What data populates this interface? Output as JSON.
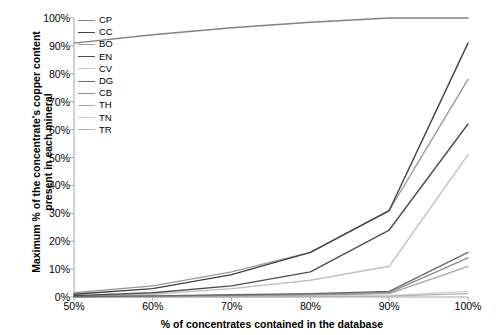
{
  "chart_data": {
    "type": "line",
    "title": "",
    "xlabel": "% of concentrates contained in the database",
    "ylabel": "Maximum % of the concentrate's copper content present in each mineral",
    "x": [
      50,
      60,
      70,
      80,
      90,
      100
    ],
    "x_tick_labels": [
      "50%",
      "60%",
      "70%",
      "80%",
      "90%",
      "100%"
    ],
    "y_tick_labels": [
      "0%",
      "10%",
      "20%",
      "30%",
      "40%",
      "50%",
      "60%",
      "70%",
      "80%",
      "90%",
      "100%"
    ],
    "xlim": [
      50,
      100
    ],
    "ylim": [
      0,
      100
    ],
    "grid": false,
    "legend_position": "upper-left-inside",
    "series": [
      {
        "name": "CP",
        "color": "#808080",
        "width": 1.4,
        "values": [
          91,
          94,
          96.5,
          98.5,
          100,
          100
        ]
      },
      {
        "name": "CC",
        "color": "#404040",
        "width": 1.4,
        "values": [
          1,
          3,
          8,
          16,
          31,
          91
        ]
      },
      {
        "name": "BO",
        "color": "#999999",
        "width": 1.4,
        "values": [
          1.5,
          4,
          9,
          16,
          31,
          78
        ]
      },
      {
        "name": "EN",
        "color": "#4d4d4d",
        "width": 1.4,
        "values": [
          0.5,
          1.5,
          4,
          9,
          24,
          62
        ]
      },
      {
        "name": "CV",
        "color": "#bfbfbf",
        "width": 1.4,
        "values": [
          0.3,
          1,
          3,
          6,
          11,
          51
        ]
      },
      {
        "name": "DG",
        "color": "#6b6b6b",
        "width": 1.4,
        "values": [
          0.2,
          0.4,
          0.8,
          1.2,
          2,
          16
        ]
      },
      {
        "name": "CB",
        "color": "#8c8c8c",
        "width": 1.4,
        "values": [
          0.1,
          0.3,
          0.6,
          1,
          1.6,
          14
        ]
      },
      {
        "name": "TH",
        "color": "#a6a6a6",
        "width": 1.4,
        "values": [
          0.1,
          0.2,
          0.4,
          0.7,
          1.2,
          11
        ]
      },
      {
        "name": "TN",
        "color": "#cccccc",
        "width": 1.4,
        "values": [
          0.05,
          0.1,
          0.2,
          0.3,
          0.5,
          2
        ]
      },
      {
        "name": "TR",
        "color": "#b3b3b3",
        "width": 1.4,
        "values": [
          0.02,
          0.05,
          0.1,
          0.15,
          0.3,
          1.2
        ]
      }
    ]
  },
  "axis": {
    "line_color": "#a6a6a6"
  }
}
